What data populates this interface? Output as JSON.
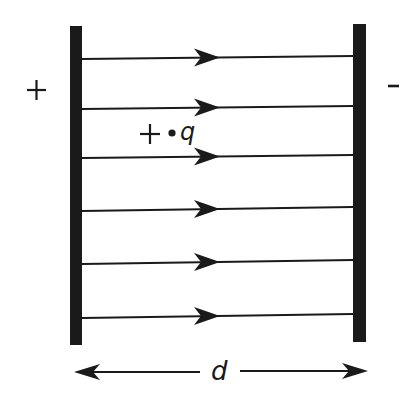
{
  "diagram": {
    "left_plate": {
      "sign_label": "+",
      "x": 70,
      "y": 26,
      "width": 12,
      "height": 319
    },
    "right_plate": {
      "sign_label": "-",
      "x": 353,
      "y": 24,
      "width": 13,
      "height": 318
    },
    "field_lines": [
      {
        "y_left": 59,
        "y_right": 56
      },
      {
        "y_left": 109,
        "y_right": 106
      },
      {
        "y_left": 158,
        "y_right": 155
      },
      {
        "y_left": 211,
        "y_right": 207
      },
      {
        "y_left": 264,
        "y_right": 260
      },
      {
        "y_left": 318,
        "y_right": 314
      }
    ],
    "field_direction": "left-to-right",
    "charge": {
      "sign": "+",
      "label": "q"
    },
    "separation": {
      "label": "d"
    },
    "colors": {
      "ink": "#1a1a1a",
      "background": "#ffffff"
    }
  }
}
